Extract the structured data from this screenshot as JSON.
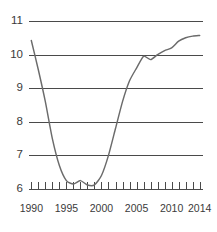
{
  "chart_data": {
    "type": "line",
    "title": "",
    "subtitle": "",
    "xlabel": "",
    "ylabel": "",
    "xlim": [
      1989.6,
      2014.4
    ],
    "ylim": [
      6,
      11
    ],
    "grid": true,
    "grid_axis": "y",
    "legend": false,
    "legend_position": "none",
    "line_color": "#6b6b6b",
    "grid_color": "#4a4a4a",
    "text_color": "#3a3a3a",
    "background_color": "#ffffff",
    "y_ticks": [
      11,
      10,
      9,
      8,
      7,
      6
    ],
    "y_tick_labels": [
      "11",
      "10",
      "9",
      "8",
      "7",
      "6"
    ],
    "x_ticks": [
      1990,
      1995,
      2000,
      2005,
      2010,
      2014
    ],
    "x_tick_labels": [
      "1990",
      "1995",
      "2000",
      "2005",
      "2010",
      "2014"
    ],
    "x_minor_tick_years": [
      1990,
      1991,
      1992,
      1993,
      1994,
      1995,
      1996,
      1997,
      1998,
      1999,
      2000,
      2001,
      2002,
      2003,
      2004,
      2005,
      2006,
      2007,
      2008,
      2009,
      2010,
      2011,
      2012,
      2013,
      2014
    ],
    "series": [
      {
        "name": "series-1",
        "x": [
          1990,
          1991,
          1992,
          1993,
          1994,
          1995,
          1996,
          1997,
          1998,
          1999,
          2000,
          2001,
          2002,
          2003,
          2004,
          2005,
          2006,
          2007,
          2008,
          2009,
          2010,
          2011,
          2012,
          2013,
          2014
        ],
        "values": [
          10.42,
          9.55,
          8.6,
          7.5,
          6.7,
          6.25,
          6.15,
          6.25,
          6.12,
          6.12,
          6.4,
          7.0,
          7.8,
          8.6,
          9.22,
          9.6,
          9.95,
          9.85,
          10.0,
          10.12,
          10.2,
          10.4,
          10.5,
          10.55,
          10.57
        ]
      }
    ]
  },
  "axes": {
    "y_axis_name": "value-axis",
    "x_axis_name": "year-axis"
  }
}
